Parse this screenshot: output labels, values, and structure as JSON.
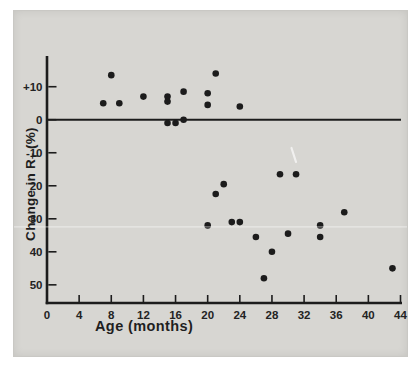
{
  "figure": {
    "page_background": "#ffffff",
    "panel_color": "#d7d6d2",
    "ink_color": "#1c1c1c"
  },
  "chart_data": {
    "type": "scatter",
    "title": "",
    "xlabel": "Age (months)",
    "ylabel_pre": "Change in R",
    "ylabel_sub": "T",
    "ylabel_post": " (%)",
    "xlim": [
      0,
      44
    ],
    "ylim": [
      -55.5,
      19
    ],
    "grid": false,
    "zero_line": true,
    "legend": "none",
    "marker": "filled-circle",
    "marker_color": "#1c1c1c",
    "x_ticks": [
      {
        "v": 0,
        "label": "0"
      },
      {
        "v": 4,
        "label": "4"
      },
      {
        "v": 8,
        "label": "8"
      },
      {
        "v": 12,
        "label": "12"
      },
      {
        "v": 16,
        "label": "16"
      },
      {
        "v": 20,
        "label": "20"
      },
      {
        "v": 24,
        "label": "24"
      },
      {
        "v": 28,
        "label": "28"
      },
      {
        "v": 32,
        "label": "32"
      },
      {
        "v": 36,
        "label": "36"
      },
      {
        "v": 40,
        "label": "40"
      },
      {
        "v": 44,
        "label": "44"
      }
    ],
    "y_ticks": [
      {
        "v": 10,
        "label": "+10"
      },
      {
        "v": 0,
        "label": "0"
      },
      {
        "v": -10,
        "label": "-10"
      },
      {
        "v": -20,
        "label": "20"
      },
      {
        "v": -30,
        "label": "30"
      },
      {
        "v": -40,
        "label": "40"
      },
      {
        "v": -50,
        "label": "50"
      }
    ],
    "points": [
      [
        7,
        5
      ],
      [
        8,
        13.5
      ],
      [
        9,
        5
      ],
      [
        12,
        7
      ],
      [
        15,
        7
      ],
      [
        15,
        5.5
      ],
      [
        15,
        -1
      ],
      [
        16,
        -1
      ],
      [
        17,
        8.5
      ],
      [
        17,
        0
      ],
      [
        20,
        8
      ],
      [
        20,
        4.5
      ],
      [
        20,
        -32
      ],
      [
        21,
        14
      ],
      [
        21,
        -22.5
      ],
      [
        22,
        -19.5
      ],
      [
        23,
        -31
      ],
      [
        24,
        4
      ],
      [
        24,
        -31
      ],
      [
        26,
        -35.5
      ],
      [
        27,
        -48
      ],
      [
        28,
        -40
      ],
      [
        29,
        -16.5
      ],
      [
        30,
        -34.5
      ],
      [
        31,
        -16.5
      ],
      [
        34,
        -32
      ],
      [
        34,
        -35.5
      ],
      [
        37,
        -28
      ],
      [
        43,
        -45
      ]
    ]
  }
}
